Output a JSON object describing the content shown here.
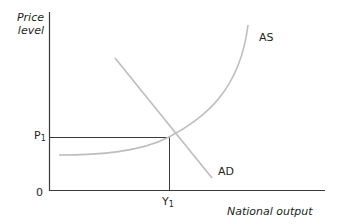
{
  "diagram": {
    "type": "AD-AS model",
    "y_axis_label_line1": "Price",
    "y_axis_label_line2": "level",
    "x_axis_label": "National output",
    "origin_label": "0",
    "price_equilibrium_label": "P",
    "price_equilibrium_subscript": "1",
    "output_equilibrium_label": "Y",
    "output_equilibrium_subscript": "1",
    "curves": [
      {
        "name": "AS",
        "label": "AS",
        "shape": "flat then steeply rising convex curve",
        "color": "#bdbdbd"
      },
      {
        "name": "AD",
        "label": "AD",
        "shape": "downward sloping straight line",
        "color": "#bdbdbd"
      }
    ],
    "axis_color": "#3a3a3a",
    "guide_line_color": "#3a3a3a"
  }
}
